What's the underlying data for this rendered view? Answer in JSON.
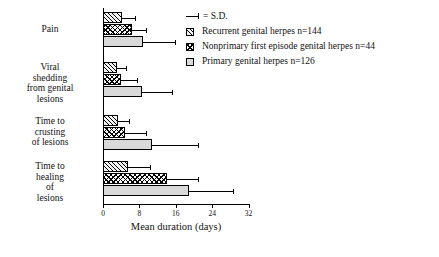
{
  "chart_data": {
    "type": "bar",
    "orientation": "horizontal",
    "title": "",
    "xlabel": "Mean duration (days)",
    "ylabel": "",
    "xlim": [
      0,
      32
    ],
    "xticks": [
      0,
      8,
      16,
      24,
      32
    ],
    "grid": false,
    "legend_position": "top-right",
    "error_bars": "S.D.",
    "categories": [
      "Pain",
      "Viral\nshedding\nfrom genital\nlesions",
      "Time to\ncrusting\nof lesions",
      "Time to\nhealing\nof\nlesions"
    ],
    "series": [
      {
        "name": "Recurrent genital herpes n=144",
        "n": 144,
        "pattern": "diagonal-hatch",
        "values": [
          4.2,
          3.0,
          3.3,
          5.5
        ],
        "sd": [
          2.8,
          2.0,
          2.5,
          4.8
        ]
      },
      {
        "name": "Nonprimary first episode genital herpes n=44",
        "n": 44,
        "pattern": "checkerboard",
        "values": [
          6.4,
          4.0,
          4.8,
          14.0
        ],
        "sd": [
          3.0,
          3.4,
          4.6,
          7.0
        ]
      },
      {
        "name": "Primary genital herpes n=126",
        "n": 126,
        "pattern": "stipple",
        "values": [
          8.8,
          8.5,
          10.8,
          19.0
        ],
        "sd": [
          7.0,
          6.6,
          10.0,
          9.5
        ]
      }
    ]
  },
  "axis": {
    "x_title": "Mean duration (days)",
    "tick_labels": [
      "0",
      "8",
      "16",
      "24",
      "32"
    ]
  },
  "categories": {
    "pain": "Pain",
    "viral_shedding": "Viral\nshedding\nfrom genital\nlesions",
    "crusting": "Time to\ncrusting\nof lesions",
    "healing": "Time to\nhealing\nof\nlesions"
  },
  "legend": {
    "sd_label": "= S.D.",
    "items": [
      "Recurrent genital herpes n=144",
      "Nonprimary first episode genital herpes n=44",
      "Primary genital herpes n=126"
    ]
  }
}
